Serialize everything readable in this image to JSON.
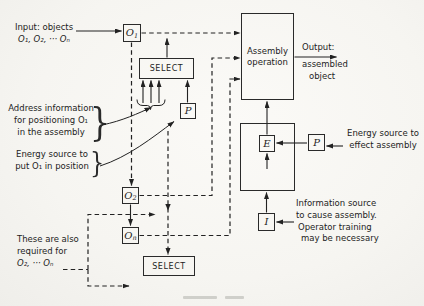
{
  "figure": {
    "labels": {
      "input": {
        "lines": [
          "Input: objects",
          "O₁, O₂, ··· Oₙ"
        ]
      },
      "address": {
        "lines": [
          "Address information",
          "for positioning O₁",
          "in the assembly"
        ]
      },
      "energy_left": {
        "lines": [
          "Energy source to",
          "put O₁ in position"
        ]
      },
      "also_required": {
        "lines": [
          "These are also",
          "required for",
          "O₂, ··· Oₙ"
        ]
      },
      "output": {
        "lines": [
          "Output:",
          "assembled",
          "object"
        ]
      },
      "energy_right": {
        "lines": [
          "Energy source to",
          "effect assembly"
        ]
      },
      "info_right": {
        "lines": [
          "Information source",
          "to cause assembly.",
          "Operator training",
          "may be necessary"
        ]
      }
    },
    "boxes": {
      "o1": {
        "base": "O",
        "sub": "1"
      },
      "o2": {
        "base": "O",
        "sub": "2"
      },
      "on": {
        "base": "O",
        "sub": "n"
      },
      "select_top": {
        "label": "SELECT"
      },
      "select_bottom": {
        "label": "SELECT"
      },
      "p_top": {
        "label": "P"
      },
      "p_right": {
        "label": "P"
      },
      "e_box": {
        "label": "E"
      },
      "i_box": {
        "label": "I"
      },
      "assembly": {
        "lines": [
          "Assembly",
          "operation"
        ]
      }
    },
    "colors": {
      "ink": "#222222",
      "paper": "#f7f6f2"
    }
  }
}
